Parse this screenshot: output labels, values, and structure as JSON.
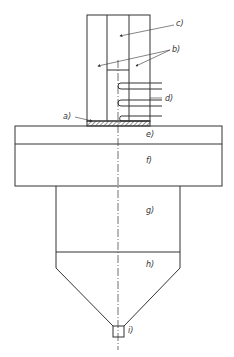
{
  "diagram": {
    "type": "technical schematic",
    "line_color": "#333333",
    "background": "#ffffff",
    "labels": [
      {
        "id": "a",
        "text": "a)"
      },
      {
        "id": "b",
        "text": "b)"
      },
      {
        "id": "c",
        "text": "c)"
      },
      {
        "id": "d",
        "text": "d)"
      },
      {
        "id": "e",
        "text": "e)"
      },
      {
        "id": "f",
        "text": "f)"
      },
      {
        "id": "g",
        "text": "g)"
      },
      {
        "id": "h",
        "text": "h)"
      },
      {
        "id": "i",
        "text": "i)"
      }
    ]
  }
}
